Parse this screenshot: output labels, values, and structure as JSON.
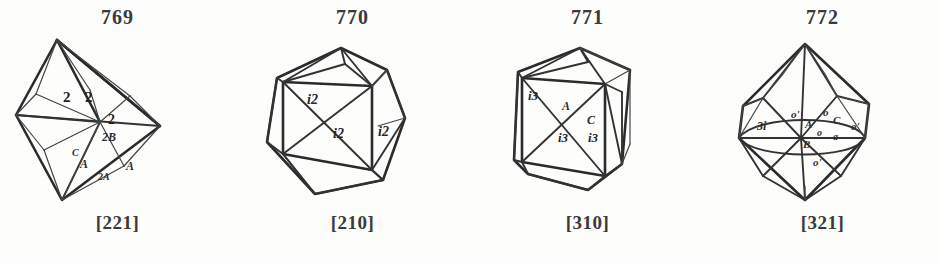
{
  "plate": {
    "background_color": "#fdfdfc",
    "ink_color": "#2b2b2b",
    "figure_count": 4
  },
  "figures": [
    {
      "number": "769",
      "index": "[221]",
      "form": "octahedron-with-trapezohedron",
      "face_labels": [
        "2",
        "2",
        "2",
        "2B",
        "C",
        "A",
        "2A",
        "A"
      ],
      "labels": [
        {
          "text": "2",
          "x": 68,
          "y": 64
        },
        {
          "text": "2",
          "x": 88,
          "y": 64
        },
        {
          "text": "2",
          "x": 110,
          "y": 86
        },
        {
          "text": "2B",
          "x": 108,
          "y": 104
        },
        {
          "text": "C",
          "x": 74,
          "y": 124
        },
        {
          "text": "A",
          "x": 84,
          "y": 134
        },
        {
          "text": "2A",
          "x": 102,
          "y": 146
        },
        {
          "text": "A",
          "x": 126,
          "y": 136
        }
      ]
    },
    {
      "number": "770",
      "index": "[210]",
      "form": "pentagonal-dodecahedron",
      "face_labels": [
        "i2",
        "i2",
        "i2"
      ],
      "labels": [
        {
          "text": "i2",
          "x": 72,
          "y": 66
        },
        {
          "text": "i2",
          "x": 100,
          "y": 100
        },
        {
          "text": "i2",
          "x": 136,
          "y": 98
        }
      ]
    },
    {
      "number": "771",
      "index": "[310]",
      "form": "pentagonal-dodecahedron",
      "face_labels": [
        "i3",
        "A",
        "C",
        "i3",
        "i3"
      ],
      "labels": [
        {
          "text": "i3",
          "x": 62,
          "y": 62
        },
        {
          "text": "A",
          "x": 94,
          "y": 72
        },
        {
          "text": "C",
          "x": 118,
          "y": 88
        },
        {
          "text": "i3",
          "x": 90,
          "y": 104
        },
        {
          "text": "i3",
          "x": 120,
          "y": 104
        }
      ]
    },
    {
      "number": "772",
      "index": "[321]",
      "form": "hexoctahedron",
      "face_labels": [
        "3i",
        "o'",
        "o",
        "A",
        "o",
        "C",
        "a",
        "o",
        "o'"
      ],
      "labels": [
        {
          "text": "3i",
          "x": 56,
          "y": 92
        },
        {
          "text": "o'",
          "x": 90,
          "y": 82
        },
        {
          "text": "o",
          "x": 120,
          "y": 80
        },
        {
          "text": "A",
          "x": 102,
          "y": 92
        },
        {
          "text": "o",
          "x": 112,
          "y": 100
        },
        {
          "text": "C",
          "x": 130,
          "y": 90
        },
        {
          "text": "a",
          "x": 128,
          "y": 104
        },
        {
          "text": "o'",
          "x": 150,
          "y": 94
        },
        {
          "text": "B",
          "x": 100,
          "y": 110
        },
        {
          "text": "o'",
          "x": 110,
          "y": 128
        }
      ]
    }
  ]
}
